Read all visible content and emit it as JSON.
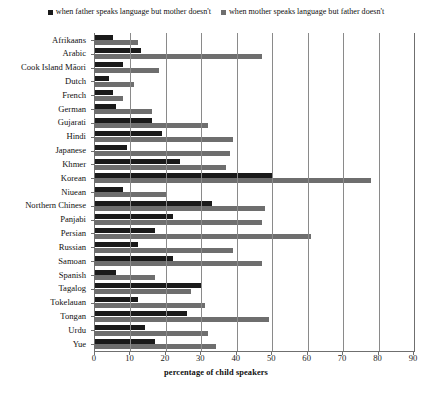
{
  "chart_data": {
    "type": "bar",
    "orientation": "horizontal",
    "title": "",
    "xlabel": "percentage of child speakers",
    "ylabel": "",
    "xlim": [
      0,
      90
    ],
    "xticks": [
      0,
      10,
      20,
      30,
      40,
      50,
      60,
      70,
      80,
      90
    ],
    "grid": true,
    "legend_position": "top-center",
    "categories": [
      "Afrikaans",
      "Arabic",
      "Cook Island Māori",
      "Dutch",
      "French",
      "German",
      "Gujarati",
      "Hindi",
      "Japanese",
      "Khmer",
      "Korean",
      "Niuean",
      "Northern Chinese",
      "Panjabi",
      "Persian",
      "Russian",
      "Samoan",
      "Spanish",
      "Tagalog",
      "Tokelauan",
      "Tongan",
      "Urdu",
      "Yue"
    ],
    "series": [
      {
        "name": "when father speaks language but mother doesn't",
        "color": "#1a1a1a",
        "values": [
          5,
          13,
          8,
          4,
          5,
          6,
          16,
          19,
          9,
          24,
          50,
          8,
          33,
          22,
          17,
          12,
          22,
          6,
          30,
          12,
          26,
          14,
          17
        ]
      },
      {
        "name": "when mother speaks language but father doesn't",
        "color": "#6e6e6e",
        "values": [
          12,
          47,
          18,
          11,
          8,
          16,
          32,
          39,
          38,
          37,
          78,
          20,
          48,
          47,
          61,
          39,
          47,
          17,
          27,
          31,
          49,
          32,
          34
        ]
      }
    ]
  },
  "legend": {
    "items": [
      {
        "label": "when father speaks language but mother doesn't",
        "color": "#1a1a1a"
      },
      {
        "label": "when mother speaks language but father doesn't",
        "color": "#6e6e6e"
      }
    ]
  }
}
